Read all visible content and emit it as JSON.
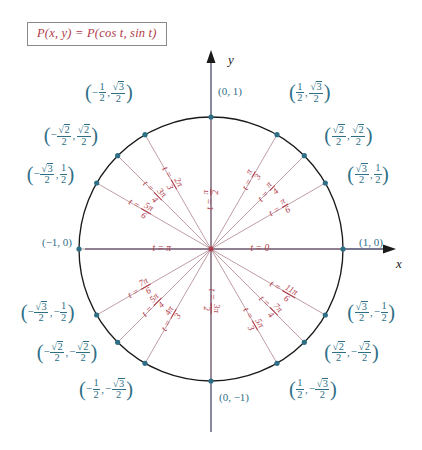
{
  "figure": {
    "title_box": "P(x, y) = P(cos t, sin t)",
    "axes": {
      "x_label": "x",
      "y_label": "y"
    },
    "colors": {
      "point_blue": "#2f6f86",
      "angle_red": "#b03a48",
      "circle_black": "#1a1a1a",
      "radius_line": "#b58b93",
      "box_border": "#8a8a8a"
    },
    "circle": {
      "center_x": 211,
      "center_y": 249,
      "radius": 132
    },
    "points": [
      {
        "name": "t-0",
        "angle_deg": 0,
        "t_label": "t = 0",
        "coord": "(1, 0)",
        "coord_align": "right"
      },
      {
        "name": "t-pi6",
        "angle_deg": 30,
        "t_label": "t = π/6",
        "coord": "(√3/2, 1/2)",
        "coord_align": "right"
      },
      {
        "name": "t-pi4",
        "angle_deg": 45,
        "t_label": "t = π/4",
        "coord": "(√2/2, √2/2)",
        "coord_align": "right"
      },
      {
        "name": "t-pi3",
        "angle_deg": 60,
        "t_label": "t = π/3",
        "coord": "(1/2, √3/2)",
        "coord_align": "right"
      },
      {
        "name": "t-pi2",
        "angle_deg": 90,
        "t_label": "t = π/2",
        "coord": "(0, 1)",
        "coord_align": "right"
      },
      {
        "name": "t-2pi3",
        "angle_deg": 120,
        "t_label": "t = 2π/3",
        "coord": "(-1/2, √3/2)",
        "coord_align": "left"
      },
      {
        "name": "t-3pi4",
        "angle_deg": 135,
        "t_label": "t = 3π/4",
        "coord": "(-√2/2, √2/2)",
        "coord_align": "left"
      },
      {
        "name": "t-5pi6",
        "angle_deg": 150,
        "t_label": "t = 5π/6",
        "coord": "(-√3/2, 1/2)",
        "coord_align": "left"
      },
      {
        "name": "t-pi",
        "angle_deg": 180,
        "t_label": "t = π",
        "coord": "(-1, 0)",
        "coord_align": "left"
      },
      {
        "name": "t-7pi6",
        "angle_deg": 210,
        "t_label": "t = 7π/6",
        "coord": "(-√3/2, -1/2)",
        "coord_align": "left"
      },
      {
        "name": "t-5pi4",
        "angle_deg": 225,
        "t_label": "t = 5π/4",
        "coord": "(-√2/2, -√2/2)",
        "coord_align": "left"
      },
      {
        "name": "t-4pi3",
        "angle_deg": 240,
        "t_label": "t = 4π/3",
        "coord": "(-1/2, -√3/2)",
        "coord_align": "left"
      },
      {
        "name": "t-3pi2",
        "angle_deg": 270,
        "t_label": "t = 3π/2",
        "coord": "(0, -1)",
        "coord_align": "center"
      },
      {
        "name": "t-5pi3",
        "angle_deg": 300,
        "t_label": "t = 5π/3",
        "coord": "(1/2, -√3/2)",
        "coord_align": "right"
      },
      {
        "name": "t-7pi4",
        "angle_deg": 315,
        "t_label": "t = 7π/4",
        "coord": "(√2/2, -√2/2)",
        "coord_align": "right"
      },
      {
        "name": "t-11pi6",
        "angle_deg": 330,
        "t_label": "t = 11π/6",
        "coord": "(√3/2, -1/2)",
        "coord_align": "right"
      }
    ]
  },
  "labels": {
    "c_1_0": {
      "x": "1",
      "y": "0"
    },
    "c_0_1": {
      "x": "0",
      "y": "1"
    },
    "c_neg1_0": {
      "x": "-1",
      "y": "0"
    },
    "c_0_neg1": {
      "x": "0",
      "y": "-1"
    }
  },
  "chart_data": {
    "type": "scatter",
    "xlabel": "x",
    "ylabel": "y",
    "xlim": [
      -1.35,
      1.35
    ],
    "ylim": [
      -1.35,
      1.35
    ],
    "grid": false,
    "legend": "none",
    "series": [
      {
        "name": "unit circle special angles",
        "points": [
          {
            "t": "0",
            "t_deg": 0,
            "x": 1,
            "y": 0,
            "x_text": "1",
            "y_text": "0"
          },
          {
            "t": "π/6",
            "t_deg": 30,
            "x": 0.866,
            "y": 0.5,
            "x_text": "√3/2",
            "y_text": "1/2"
          },
          {
            "t": "π/4",
            "t_deg": 45,
            "x": 0.7071,
            "y": 0.7071,
            "x_text": "√2/2",
            "y_text": "√2/2"
          },
          {
            "t": "π/3",
            "t_deg": 60,
            "x": 0.5,
            "y": 0.866,
            "x_text": "1/2",
            "y_text": "√3/2"
          },
          {
            "t": "π/2",
            "t_deg": 90,
            "x": 0,
            "y": 1,
            "x_text": "0",
            "y_text": "1"
          },
          {
            "t": "2π/3",
            "t_deg": 120,
            "x": -0.5,
            "y": 0.866,
            "x_text": "-1/2",
            "y_text": "√3/2"
          },
          {
            "t": "3π/4",
            "t_deg": 135,
            "x": -0.7071,
            "y": 0.7071,
            "x_text": "-√2/2",
            "y_text": "√2/2"
          },
          {
            "t": "5π/6",
            "t_deg": 150,
            "x": -0.866,
            "y": 0.5,
            "x_text": "-√3/2",
            "y_text": "1/2"
          },
          {
            "t": "π",
            "t_deg": 180,
            "x": -1,
            "y": 0,
            "x_text": "-1",
            "y_text": "0"
          },
          {
            "t": "7π/6",
            "t_deg": 210,
            "x": -0.866,
            "y": -0.5,
            "x_text": "-√3/2",
            "y_text": "-1/2"
          },
          {
            "t": "5π/4",
            "t_deg": 225,
            "x": -0.7071,
            "y": -0.7071,
            "x_text": "-√2/2",
            "y_text": "-√2/2"
          },
          {
            "t": "4π/3",
            "t_deg": 240,
            "x": -0.5,
            "y": -0.866,
            "x_text": "-1/2",
            "y_text": "-√3/2"
          },
          {
            "t": "3π/2",
            "t_deg": 270,
            "x": 0,
            "y": -1,
            "x_text": "0",
            "y_text": "-1"
          },
          {
            "t": "5π/3",
            "t_deg": 300,
            "x": 0.5,
            "y": -0.866,
            "x_text": "1/2",
            "y_text": "-√3/2"
          },
          {
            "t": "7π/4",
            "t_deg": 315,
            "x": 0.7071,
            "y": -0.7071,
            "x_text": "√2/2",
            "y_text": "-√2/2"
          },
          {
            "t": "11π/6",
            "t_deg": 330,
            "x": 0.866,
            "y": -0.5,
            "x_text": "√3/2",
            "y_text": "-1/2"
          }
        ]
      }
    ]
  }
}
